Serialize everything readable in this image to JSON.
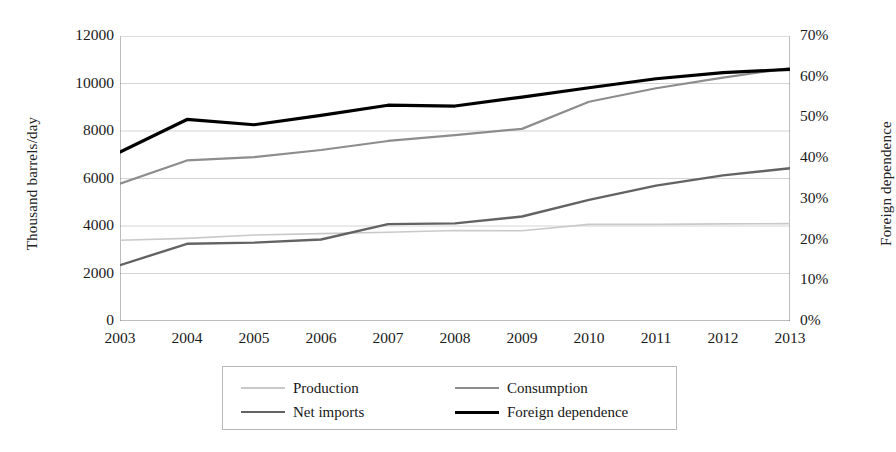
{
  "chart_data": {
    "type": "line",
    "title": "",
    "subtitle": "",
    "xlabel": "",
    "ylabel": "Thousand barrels/day",
    "y2label": "Foreign dependence",
    "x": [
      2003,
      2004,
      2005,
      2006,
      2007,
      2008,
      2009,
      2010,
      2011,
      2012,
      2013
    ],
    "categories": [
      "2003",
      "2004",
      "2005",
      "2006",
      "2007",
      "2008",
      "2009",
      "2010",
      "2011",
      "2012",
      "2013"
    ],
    "ylim": [
      0,
      12000
    ],
    "y2lim": [
      0,
      70
    ],
    "yticks": [
      0,
      2000,
      4000,
      6000,
      8000,
      10000,
      12000
    ],
    "ytick_labels": [
      "0",
      "2000",
      "4000",
      "6000",
      "8000",
      "10000",
      "12000"
    ],
    "y2ticks": [
      0,
      10,
      20,
      30,
      40,
      50,
      60,
      70
    ],
    "y2tick_labels": [
      "0%",
      "10%",
      "20%",
      "30%",
      "40%",
      "50%",
      "60%",
      "70%"
    ],
    "grid": true,
    "grid_axis": "y",
    "legend_position": "bottom",
    "legend_columns": 2,
    "series": [
      {
        "name": "Production",
        "axis": "left",
        "color": "#c9c9c9",
        "width": 1.6,
        "values": [
          3400,
          3480,
          3620,
          3680,
          3740,
          3810,
          3800,
          4070,
          4070,
          4090,
          4100
        ]
      },
      {
        "name": "Consumption",
        "axis": "left",
        "color": "#8d8d8d",
        "width": 2.2,
        "values": [
          5780,
          6760,
          6900,
          7200,
          7580,
          7830,
          8090,
          9230,
          9800,
          10250,
          10650
        ]
      },
      {
        "name": "Net imports",
        "axis": "left",
        "color": "#636363",
        "width": 2.4,
        "values": [
          2350,
          3250,
          3300,
          3430,
          4080,
          4110,
          4400,
          5100,
          5700,
          6130,
          6430
        ]
      },
      {
        "name": "Foreign dependence",
        "axis": "right",
        "color": "#000000",
        "width": 3.2,
        "values": [
          41.5,
          49.5,
          48.2,
          50.5,
          53.0,
          52.8,
          55.0,
          57.3,
          59.5,
          61.0,
          61.8
        ]
      }
    ]
  },
  "legend": {
    "items": [
      {
        "label": "Production",
        "swatch_color": "#c9c9c9",
        "swatch_width": 2
      },
      {
        "label": "Consumption",
        "swatch_color": "#8d8d8d",
        "swatch_width": 2.4
      },
      {
        "label": "Net imports",
        "swatch_color": "#636363",
        "swatch_width": 2.6
      },
      {
        "label": "Foreign dependence",
        "swatch_color": "#000000",
        "swatch_width": 3.4
      }
    ]
  },
  "axes": {
    "left_title": "Thousand barrels/day",
    "right_title": "Foreign dependence"
  },
  "colors": {
    "background": "#ffffff",
    "axis_line": "#7a7a7a",
    "gridline": "#cfcfcf",
    "text": "#1a1a1a",
    "legend_border": "#b9b9b9"
  }
}
